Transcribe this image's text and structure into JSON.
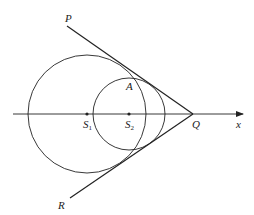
{
  "diagram": {
    "type": "geometry",
    "colors": {
      "stroke": "#222222",
      "background": "#ffffff"
    },
    "axis": {
      "label": "x",
      "y": 114,
      "x_start": 13,
      "x_end": 244
    },
    "points": {
      "P": {
        "label": "P",
        "x": 67,
        "y": 26
      },
      "Q": {
        "label": "Q",
        "x": 193,
        "y": 114
      },
      "R": {
        "label": "R",
        "x": 70,
        "y": 198
      },
      "A": {
        "label": "A",
        "x": 131,
        "y": 83
      },
      "S1": {
        "label": "S",
        "sub": "1",
        "x": 87,
        "y": 114
      },
      "S2": {
        "label": "S",
        "sub": "2",
        "x": 129,
        "y": 114
      }
    },
    "circles": [
      {
        "name": "circle-S1",
        "cx": 87,
        "cy": 114,
        "r": 59
      },
      {
        "name": "circle-S2",
        "cx": 129,
        "cy": 114,
        "r": 36
      }
    ],
    "lines": [
      {
        "name": "line-PQ",
        "from": "P",
        "to": "Q"
      },
      {
        "name": "line-RQ",
        "from": "R",
        "to": "Q"
      }
    ]
  }
}
